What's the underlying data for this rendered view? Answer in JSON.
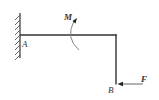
{
  "diagram": {
    "type": "statics-frame",
    "labels": {
      "support": "A",
      "free_end": "B",
      "moment": "M",
      "force": "F"
    },
    "colors": {
      "line": "#333333",
      "moment_arc": "#777777",
      "background": "#ffffff"
    }
  }
}
